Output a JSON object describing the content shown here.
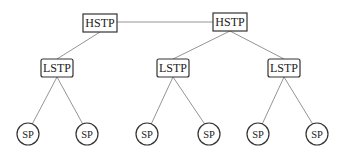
{
  "diagram": {
    "type": "network-hierarchy",
    "colors": {
      "background": "#ffffff",
      "stroke": "#333333",
      "link": "#888888",
      "text": "#222222"
    },
    "hstp": [
      {
        "id": "hstp1",
        "label": "HSTP",
        "cx": 100,
        "cy": 23
      },
      {
        "id": "hstp2",
        "label": "HSTP",
        "cx": 230,
        "cy": 22
      }
    ],
    "lstp": [
      {
        "id": "lstp1",
        "label": "LSTP",
        "cx": 57,
        "cy": 68,
        "parent": "hstp1"
      },
      {
        "id": "lstp2",
        "label": "LSTP",
        "cx": 173,
        "cy": 68,
        "parent": "hstp2"
      },
      {
        "id": "lstp3",
        "label": "LSTP",
        "cx": 284,
        "cy": 68,
        "parent": "hstp2"
      }
    ],
    "sp": [
      {
        "id": "sp1",
        "label": "SP",
        "cx": 28,
        "cy": 134,
        "parent": "lstp1"
      },
      {
        "id": "sp2",
        "label": "SP",
        "cx": 87,
        "cy": 134,
        "parent": "lstp1"
      },
      {
        "id": "sp3",
        "label": "SP",
        "cx": 147,
        "cy": 134,
        "parent": "lstp2"
      },
      {
        "id": "sp4",
        "label": "SP",
        "cx": 209,
        "cy": 134,
        "parent": "lstp2"
      },
      {
        "id": "sp5",
        "label": "SP",
        "cx": 258,
        "cy": 134,
        "parent": "lstp3"
      },
      {
        "id": "sp6",
        "label": "SP",
        "cx": 317,
        "cy": 134,
        "parent": "lstp3"
      }
    ],
    "peer_links": [
      [
        "hstp1",
        "hstp2"
      ]
    ]
  }
}
